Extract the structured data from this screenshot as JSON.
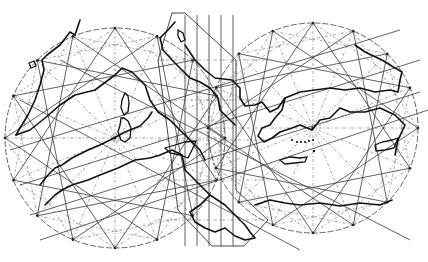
{
  "map": {
    "title": "",
    "description": "Portolan-style line drawing of the Mediterranean with two windrose circles and a central band of rhumb lines",
    "style": "black-and-white line drawing",
    "colors": {
      "ink": "#111111",
      "grid": "#3a3a3a",
      "background": "#ffffff"
    },
    "features": [
      {
        "name": "western-windrose-circle",
        "points": 16
      },
      {
        "name": "eastern-windrose-circle",
        "points": 16
      },
      {
        "name": "central-rhumb-band"
      },
      {
        "name": "coastline-iberia-france"
      },
      {
        "name": "coastline-italy"
      },
      {
        "name": "coastline-balkans-anatolia"
      },
      {
        "name": "coastline-north-africa"
      },
      {
        "name": "island-corsica"
      },
      {
        "name": "island-sardinia"
      },
      {
        "name": "island-sicily"
      },
      {
        "name": "island-crete"
      },
      {
        "name": "island-cyprus"
      },
      {
        "name": "aegean-islets"
      }
    ],
    "labels": []
  }
}
